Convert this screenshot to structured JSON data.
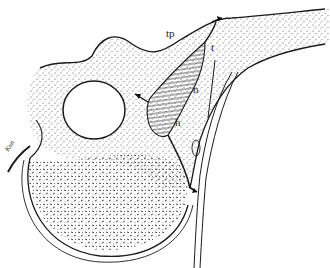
{
  "figure": {
    "labels": {
      "tp": "tp",
      "t": "t",
      "n": "n",
      "h": "h"
    },
    "signature": "Kun",
    "colors": {
      "line": "#1a1a1a",
      "stipple": "#555555",
      "background": "#ffffff"
    }
  }
}
